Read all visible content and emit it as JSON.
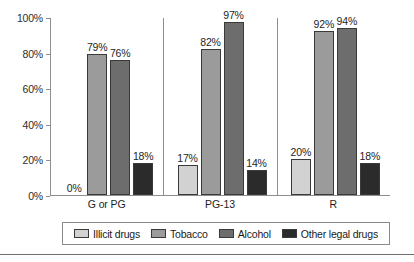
{
  "chart_data": {
    "type": "bar",
    "title": "",
    "xlabel": "",
    "ylabel": "",
    "ylim": [
      0,
      100
    ],
    "ytick_labels": [
      "0%",
      "20%",
      "40%",
      "60%",
      "80%",
      "100%"
    ],
    "ytick_values": [
      0,
      20,
      40,
      60,
      80,
      100
    ],
    "grid": false,
    "legend_position": "bottom",
    "categories": [
      "G or PG",
      "PG-13",
      "R"
    ],
    "series": [
      {
        "name": "Illicit drugs",
        "color": "#d2d2d2",
        "values": [
          0,
          17,
          20
        ],
        "labels": [
          "0%",
          "17%",
          "20%"
        ]
      },
      {
        "name": "Tobacco",
        "color": "#9b9b9b",
        "values": [
          79,
          82,
          92
        ],
        "labels": [
          "79%",
          "82%",
          "92%"
        ]
      },
      {
        "name": "Alcohol",
        "color": "#6d6d6d",
        "values": [
          76,
          97,
          94
        ],
        "labels": [
          "76%",
          "97%",
          "94%"
        ]
      },
      {
        "name": "Other legal drugs",
        "color": "#2b2b2b",
        "values": [
          18,
          14,
          18
        ],
        "labels": [
          "18%",
          "14%",
          "18%"
        ]
      }
    ]
  },
  "axis": {
    "line_color": "#8e8e8e"
  },
  "legend": {
    "items": [
      {
        "label": "Illicit drugs",
        "color": "#d2d2d2"
      },
      {
        "label": "Tobacco",
        "color": "#9b9b9b"
      },
      {
        "label": "Alcohol",
        "color": "#6d6d6d"
      },
      {
        "label": "Other legal drugs",
        "color": "#2b2b2b"
      }
    ]
  }
}
